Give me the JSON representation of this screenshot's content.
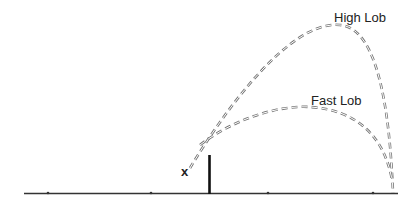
{
  "diagram": {
    "type": "tennis lob trajectories",
    "labels": {
      "high_lob": "High Lob",
      "fast_lob": "Fast Lob"
    },
    "markers": {
      "player_position": "x"
    },
    "colors": {
      "ground": "#222222",
      "net": "#111111",
      "trajectory": "#777777",
      "text": "#222222"
    }
  }
}
